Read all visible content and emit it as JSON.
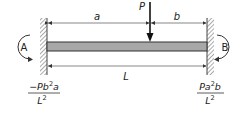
{
  "diagram": {
    "load_label": "P",
    "dim_a": "a",
    "dim_b": "b",
    "dim_L": "L",
    "support_left": "A",
    "support_right": "B",
    "moment_left": {
      "numerator_prefix": "−Pb",
      "exp1": "2",
      "numerator_suffix": "a",
      "denominator_base": "L",
      "denominator_exp": "2"
    },
    "moment_right": {
      "numerator_prefix": "Pa",
      "exp1": "2",
      "numerator_suffix": "b",
      "denominator_base": "L",
      "denominator_exp": "2"
    },
    "colors": {
      "beam_fill": "#a8a8a8",
      "beam_edge": "#333333",
      "line": "#444444",
      "text": "#222222"
    }
  }
}
